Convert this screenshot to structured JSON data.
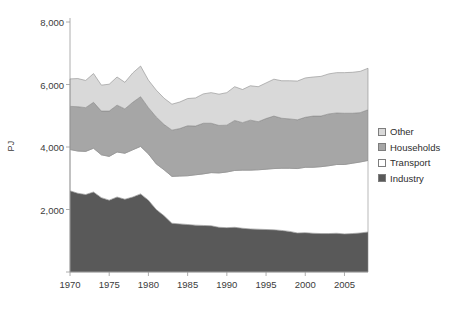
{
  "chart_data": {
    "type": "area",
    "stacked": true,
    "title": "",
    "xlabel": "",
    "ylabel": "PJ",
    "xlim": [
      1970,
      2008
    ],
    "ylim": [
      0,
      8000
    ],
    "grid": false,
    "legend_position": "right",
    "ytick_labels": [
      "2,000",
      "4,000",
      "6,000",
      "8,000"
    ],
    "ytick_values": [
      2000,
      4000,
      6000,
      8000
    ],
    "xtick_labels": [
      "1970",
      "1975",
      "1980",
      "1985",
      "1990",
      "1995",
      "2000",
      "2005"
    ],
    "xtick_values": [
      1970,
      1975,
      1980,
      1985,
      1990,
      1995,
      2000,
      2005
    ],
    "x": [
      1970,
      1971,
      1972,
      1973,
      1974,
      1975,
      1976,
      1977,
      1978,
      1979,
      1980,
      1981,
      1982,
      1983,
      1984,
      1985,
      1986,
      1987,
      1988,
      1989,
      1990,
      1991,
      1992,
      1993,
      1994,
      1995,
      1996,
      1997,
      1998,
      1999,
      2000,
      2001,
      2002,
      2003,
      2004,
      2005,
      2006,
      2007,
      2008
    ],
    "series": [
      {
        "name": "Industry",
        "color": "#595959",
        "values": [
          2600,
          2520,
          2480,
          2560,
          2380,
          2300,
          2400,
          2330,
          2400,
          2500,
          2300,
          2000,
          1800,
          1560,
          1540,
          1520,
          1500,
          1490,
          1480,
          1430,
          1420,
          1430,
          1400,
          1380,
          1370,
          1360,
          1350,
          1330,
          1300,
          1250,
          1260,
          1240,
          1230,
          1230,
          1240,
          1220,
          1230,
          1250,
          1280
        ]
      },
      {
        "name": "Transport",
        "color": "#ffffff",
        "values": [
          1320,
          1350,
          1380,
          1400,
          1370,
          1400,
          1440,
          1470,
          1510,
          1520,
          1480,
          1460,
          1470,
          1500,
          1530,
          1560,
          1610,
          1650,
          1700,
          1740,
          1780,
          1820,
          1860,
          1880,
          1900,
          1930,
          1960,
          1990,
          2020,
          2060,
          2090,
          2110,
          2140,
          2170,
          2200,
          2220,
          2250,
          2270,
          2290
        ]
      },
      {
        "name": "Households",
        "color": "#a6a6a6",
        "values": [
          1380,
          1420,
          1400,
          1470,
          1400,
          1450,
          1500,
          1420,
          1520,
          1590,
          1480,
          1500,
          1450,
          1480,
          1520,
          1600,
          1560,
          1620,
          1580,
          1520,
          1500,
          1600,
          1520,
          1600,
          1540,
          1620,
          1680,
          1600,
          1580,
          1560,
          1600,
          1640,
          1620,
          1660,
          1650,
          1640,
          1600,
          1580,
          1620
        ]
      },
      {
        "name": "Other",
        "color": "#d9d9d9",
        "values": [
          880,
          900,
          870,
          920,
          830,
          860,
          900,
          850,
          940,
          980,
          880,
          860,
          840,
          830,
          850,
          870,
          900,
          940,
          980,
          1000,
          1040,
          1080,
          1060,
          1100,
          1120,
          1140,
          1180,
          1200,
          1220,
          1240,
          1260,
          1250,
          1270,
          1280,
          1290,
          1300,
          1310,
          1320,
          1330
        ]
      }
    ]
  },
  "legend": {
    "items": [
      {
        "label": "Other",
        "color": "#d9d9d9"
      },
      {
        "label": "Households",
        "color": "#a6a6a6"
      },
      {
        "label": "Transport",
        "color": "#ffffff"
      },
      {
        "label": "Industry",
        "color": "#595959"
      }
    ]
  },
  "axes": {
    "y_title": "PJ"
  },
  "colors": {
    "axis_line": "#9a9a9a",
    "text": "#3b3b3b",
    "series_outline": "#8c8c8c"
  }
}
